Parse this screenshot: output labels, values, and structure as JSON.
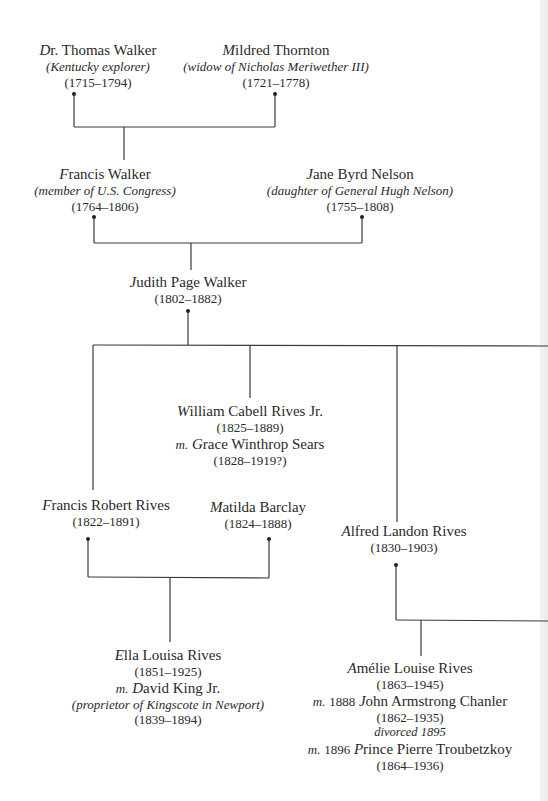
{
  "tree": {
    "thomas_walker": {
      "initial": "D",
      "name_rest": "r. Thomas Walker",
      "note": "(Kentucky explorer)",
      "dates": "(1715–1794)"
    },
    "mildred_thornton": {
      "initial": "M",
      "name_rest": "ildred Thornton",
      "note": "(widow of Nicholas Meriwether III)",
      "dates": "(1721–1778)"
    },
    "francis_walker": {
      "initial": "F",
      "name_rest": "rancis Walker",
      "note": "(member of U.S. Congress)",
      "dates": "(1764–1806)"
    },
    "jane_byrd_nelson": {
      "initial": "J",
      "name_rest": "ane Byrd Nelson",
      "note": "(daughter of General Hugh Nelson)",
      "dates": "(1755–1808)"
    },
    "judith_page_walker": {
      "initial": "J",
      "name_rest": "udith Page Walker",
      "dates": "(1802–1882)"
    },
    "william_cabell_rives": {
      "initial": "W",
      "name_rest": "illiam Cabell Rives Jr.",
      "dates": "(1825–1889)",
      "spouse_prefix": "m.",
      "spouse_initial": "G",
      "spouse_rest": "race Winthrop Sears",
      "spouse_dates": "(1828–1919?)"
    },
    "francis_robert_rives": {
      "initial": "F",
      "name_rest": "rancis Robert Rives",
      "dates": "(1822–1891)"
    },
    "matilda_barclay": {
      "initial": "M",
      "name_rest": "atilda Barclay",
      "dates": "(1824–1888)"
    },
    "alfred_landon_rives": {
      "initial": "A",
      "name_rest": "lfred Landon Rives",
      "dates": "(1830–1903)"
    },
    "ella_louisa_rives": {
      "initial": "E",
      "name_rest": "lla Louisa Rives",
      "dates": "(1851–1925)",
      "spouse_prefix": "m.",
      "spouse_initial": "D",
      "spouse_rest": "avid King Jr.",
      "spouse_note": "(proprietor of Kingscote in Newport)",
      "spouse_dates": "(1839–1894)"
    },
    "amelie_louise_rives": {
      "initial": "A",
      "name_rest": "mélie Louise Rives",
      "dates": "(1863–1945)",
      "marriage1_prefix": "m.",
      "marriage1_year": "1888",
      "marriage1_initial": "J",
      "marriage1_rest": "ohn Armstrong Chanler",
      "marriage1_dates": "(1862–1935)",
      "divorce_note": "divorced 1895",
      "marriage2_prefix": "m.",
      "marriage2_year": "1896",
      "marriage2_initial": "P",
      "marriage2_rest": "rince Pierre Troubetzkoy",
      "marriage2_dates": "(1864–1936)"
    }
  },
  "colors": {
    "line": "#3a3a3a",
    "text": "#2a2a2a"
  }
}
